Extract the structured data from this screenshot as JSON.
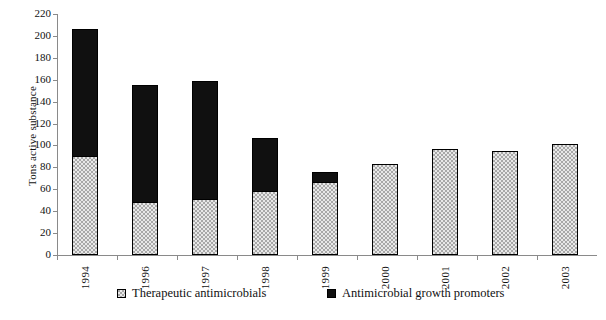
{
  "chart_data": {
    "type": "bar",
    "subtype": "stacked-bar",
    "title": "",
    "xlabel": "",
    "ylabel": "Tons active substance",
    "categories": [
      "1994",
      "1996",
      "1997",
      "1998",
      "1999",
      "2000",
      "2001",
      "2002",
      "2003"
    ],
    "series": [
      {
        "name": "Therapeutic antimicrobials",
        "color": "#a8a8a8",
        "pattern": "checkered",
        "values": [
          90,
          48,
          51,
          58,
          67,
          83,
          97,
          95,
          101
        ]
      },
      {
        "name": "Antimicrobial growth promoters",
        "color": "#101010",
        "pattern": "solid",
        "values": [
          116,
          107,
          108,
          49,
          9,
          0,
          0,
          0,
          0
        ]
      }
    ],
    "totals": [
      206,
      155,
      159,
      107,
      76,
      83,
      97,
      95,
      101
    ],
    "ylim": [
      0,
      220
    ],
    "yticks": [
      0,
      20,
      40,
      60,
      80,
      100,
      120,
      140,
      160,
      180,
      200,
      220
    ],
    "ytick_step": 20,
    "grid": false,
    "legend_position": "bottom"
  },
  "axis": {
    "y_title": "Tons active substance",
    "y_tick_labels": [
      "220",
      "200",
      "180",
      "160",
      "140",
      "120",
      "100",
      "80",
      "60",
      "40",
      "20",
      "0"
    ],
    "x_tick_labels": [
      "1994",
      "1996",
      "1997",
      "1998",
      "1999",
      "2000",
      "2001",
      "2002",
      "2003"
    ]
  },
  "legend": {
    "entries": [
      {
        "label": "Therapeutic antimicrobials",
        "swatch": "checkered-gray"
      },
      {
        "label": "Antimicrobial growth promoters",
        "swatch": "solid-black"
      }
    ]
  },
  "caption": {
    "text": "",
    "note": "cut off at bottom edge of image"
  },
  "colors": {
    "therapeutic": "#a8a8a8",
    "promoters": "#101010",
    "axis": "#8a8a8a",
    "text": "#111111",
    "background": "#ffffff"
  }
}
